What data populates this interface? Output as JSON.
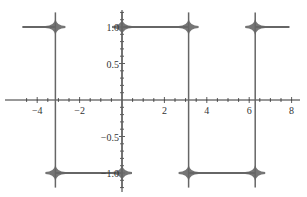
{
  "chart_data": {
    "type": "line",
    "title": "",
    "xlabel": "",
    "ylabel": "",
    "xlim": [
      -4.8,
      8.0
    ],
    "ylim": [
      -1.2,
      1.2
    ],
    "grid": false,
    "legend": null,
    "x_ticks": [
      "-4",
      "-2",
      "2",
      "4",
      "6",
      "8"
    ],
    "y_ticks": [
      "1.0",
      "0.5",
      "-0.5",
      "-1.0"
    ],
    "series": [
      {
        "name": "square wave approximation",
        "color": "#666666",
        "segments": [
          {
            "x": [
              -4.7,
              -3.1416
            ],
            "y": 1.0
          },
          {
            "x": [
              -3.1416,
              0.0
            ],
            "y": -1.0
          },
          {
            "x": [
              0.0,
              3.1416
            ],
            "y": 1.0
          },
          {
            "x": [
              3.1416,
              6.2832
            ],
            "y": -1.0
          },
          {
            "x": [
              6.2832,
              7.9
            ],
            "y": 1.0
          }
        ],
        "jumps_at": [
          -3.1416,
          0.0,
          3.1416,
          6.2832
        ]
      }
    ]
  }
}
